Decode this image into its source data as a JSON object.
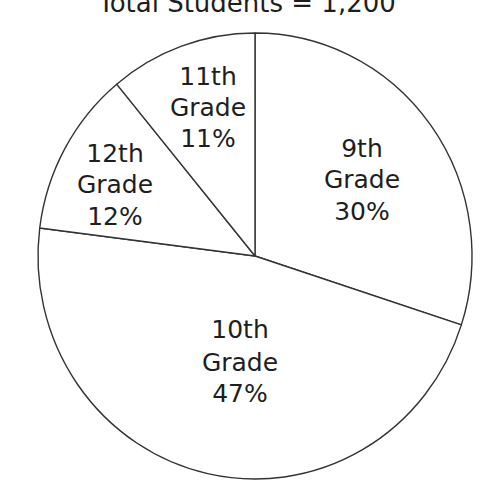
{
  "chart_data": {
    "type": "pie",
    "title": "Total Students = 1,200",
    "total": 1200,
    "categories": [
      "9th Grade",
      "10th Grade",
      "12th Grade",
      "11th Grade"
    ],
    "values": [
      30,
      47,
      12,
      11
    ],
    "unit": "%",
    "start_angle_deg": 0,
    "direction": "clockwise",
    "slices": [
      {
        "key": "grade9",
        "line1": "9th",
        "line2": "Grade",
        "pct_label": "30%",
        "value": 30
      },
      {
        "key": "grade10",
        "line1": "10th",
        "line2": "Grade",
        "pct_label": "47%",
        "value": 47
      },
      {
        "key": "grade12",
        "line1": "12th",
        "line2": "Grade",
        "pct_label": "12%",
        "value": 12
      },
      {
        "key": "grade11",
        "line1": "11th",
        "line2": "Grade",
        "pct_label": "11%",
        "value": 11
      }
    ],
    "legend": "none",
    "grid": false,
    "colors": {
      "fill": "#ffffff",
      "stroke": "#333333",
      "text": "#1e1e1e"
    }
  }
}
